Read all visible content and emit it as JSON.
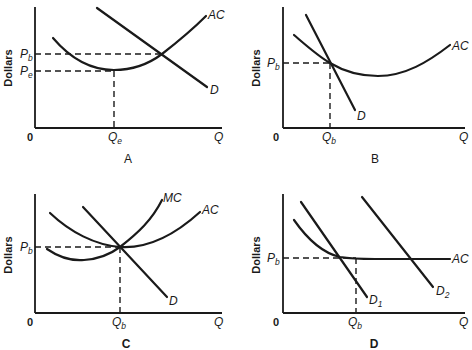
{
  "figure": {
    "y_axis_label": "Dollars",
    "x_axis_label": "Q",
    "origin_label": "0"
  },
  "panels": {
    "A": {
      "letter": "A",
      "price_labels": [
        {
          "main": "P",
          "sub": "b"
        },
        {
          "main": "P",
          "sub": "e"
        }
      ],
      "quantity_label": {
        "main": "Q",
        "sub": "e"
      },
      "curves": [
        "AC",
        "D"
      ]
    },
    "B": {
      "letter": "B",
      "price_labels": [
        {
          "main": "P",
          "sub": "b"
        }
      ],
      "quantity_label": {
        "main": "Q",
        "sub": "b"
      },
      "curves": [
        "AC",
        "D"
      ]
    },
    "C": {
      "letter": "C",
      "price_labels": [
        {
          "main": "P",
          "sub": "b"
        }
      ],
      "quantity_label": {
        "main": "Q",
        "sub": "b"
      },
      "curves": [
        "MC",
        "AC",
        "D"
      ]
    },
    "D": {
      "letter": "D",
      "price_labels": [
        {
          "main": "P",
          "sub": "b"
        }
      ],
      "quantity_label": {
        "main": "Q",
        "sub": "b"
      },
      "curves": [
        "AC",
        "D1",
        "D2"
      ],
      "curve_labels": [
        {
          "main": "D",
          "sub": "1"
        },
        {
          "main": "D",
          "sub": "2"
        }
      ]
    }
  },
  "colors": {
    "ink": "#1a1a1a",
    "background": "#ffffff"
  }
}
